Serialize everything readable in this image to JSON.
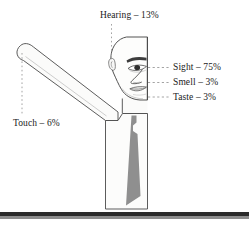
{
  "diagram": {
    "title_present": false,
    "labels": {
      "hearing": "Hearing – 13%",
      "sight": "Sight – 75%",
      "smell": "Smell – 3%",
      "taste": "Taste – 3%",
      "touch": "Touch – 6%"
    },
    "senses": [
      {
        "name": "Hearing",
        "percent": 13,
        "label": "Hearing – 13%",
        "anchor": "ear"
      },
      {
        "name": "Sight",
        "percent": 75,
        "label": "Sight – 75%",
        "anchor": "eye"
      },
      {
        "name": "Smell",
        "percent": 3,
        "label": "Smell – 3%",
        "anchor": "nose"
      },
      {
        "name": "Taste",
        "percent": 3,
        "label": "Taste – 3%",
        "anchor": "mouth"
      },
      {
        "name": "Touch",
        "percent": 6,
        "label": "Touch – 6%",
        "anchor": "hand"
      }
    ],
    "colors": {
      "background": "#ffffff",
      "outline": "#4a4a4a",
      "fill_light": "#fbfbfa",
      "shading_gray": "#8f8f8f",
      "text": "#1a1a1a",
      "leader_line": "#9a9a9a",
      "rule_dark": "#2b2b2b",
      "rule_soft": "#8d8d8d"
    }
  }
}
